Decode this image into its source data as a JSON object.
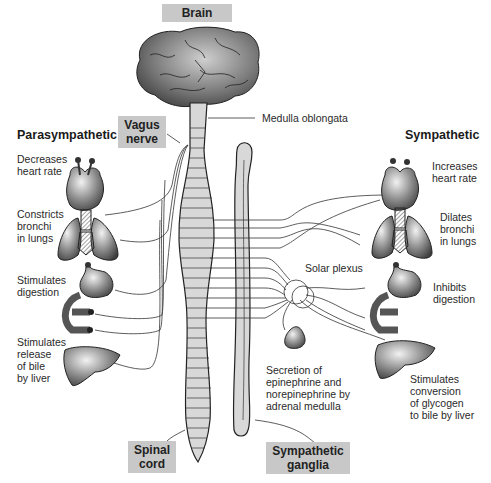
{
  "labels": {
    "brain": "Brain",
    "vagus_nerve": "Vagus\nnerve",
    "medulla": "Medulla oblongata",
    "spinal_cord": "Spinal\ncord",
    "sympathetic_ganglia": "Sympathetic\nganglia",
    "solar_plexus": "Solar plexus",
    "adrenal": "Secretion of\nepinephrine and\nnorepinephrine by\nadrenal medulla"
  },
  "parasympathetic": {
    "heading": "Parasympathetic",
    "effects": [
      {
        "organ": "heart",
        "text": "Decreases\nheart rate"
      },
      {
        "organ": "lungs",
        "text": "Constricts\nbronchi\nin lungs"
      },
      {
        "organ": "stomach",
        "text": "Stimulates\ndigestion"
      },
      {
        "organ": "liver",
        "text": "Stimulates\nrelease\nof bile\nby liver"
      }
    ]
  },
  "sympathetic": {
    "heading": "Sympathetic",
    "effects": [
      {
        "organ": "heart",
        "text": "Increases\nheart rate"
      },
      {
        "organ": "lungs",
        "text": "Dilates\nbronchi\nin lungs"
      },
      {
        "organ": "stomach",
        "text": "Inhibits\ndigestion"
      },
      {
        "organ": "liver",
        "text": "Stimulates\nconversion\nof glycogen\nto bile by liver"
      }
    ]
  },
  "colors": {
    "label_box": "#c8c8c8",
    "organ_fill": "#8a8a8a",
    "cord_fill": "#d6d6d6",
    "line": "#333333"
  }
}
